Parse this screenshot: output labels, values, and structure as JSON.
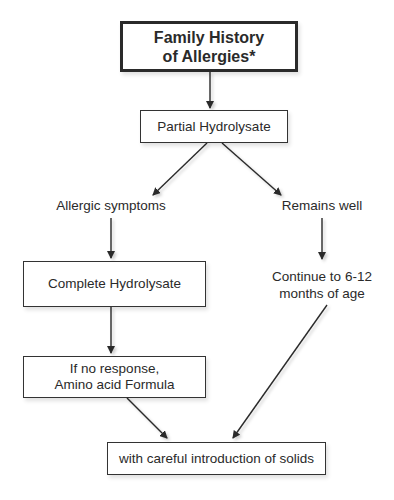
{
  "diagram": {
    "title_box": {
      "line1": "Family History",
      "line2": "of Allergies*"
    },
    "step1": "Partial Hydrolysate",
    "branch_left": "Allergic symptoms",
    "branch_right": "Remains well",
    "left_step1": "Complete Hydrolysate",
    "right_step1": {
      "line1": "Continue to 6-12",
      "line2": "months of age"
    },
    "left_step2": {
      "line1": "If no response,",
      "line2": "Amino acid Formula"
    },
    "final": "with careful introduction of solids"
  }
}
